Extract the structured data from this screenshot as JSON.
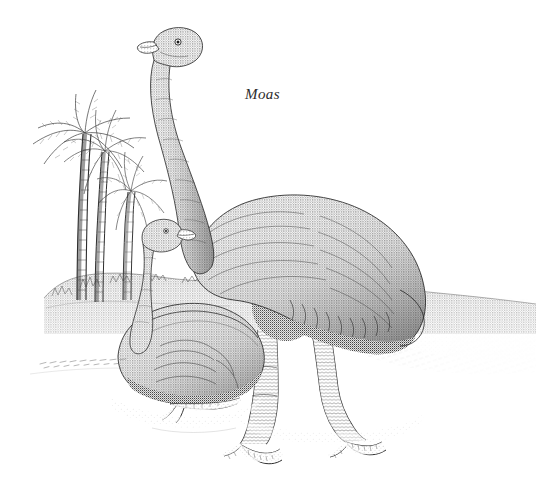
{
  "plate": {
    "caption": "Moas",
    "background_color": "#ffffff",
    "ink_color": "#2b2b2b",
    "width": 536,
    "height": 487,
    "medium": "stipple-engraving",
    "style_note": "black-and-white stippled pen-and-ink natural-history engraving"
  },
  "subjects": [
    {
      "id": "standing-moa",
      "label": "Standing moa",
      "pose": "upright, long neck curved, head raised facing left",
      "parts": [
        "head",
        "beak",
        "eye",
        "long-neck",
        "feathered-body",
        "thigh",
        "scaly-legs",
        "three-toed-feet"
      ]
    },
    {
      "id": "sitting-moa",
      "label": "Sitting moa",
      "pose": "crouched on ground in foreground, neck raised, head facing left",
      "parts": [
        "head",
        "beak",
        "eye",
        "neck",
        "feathered-body",
        "outstretched-foot"
      ]
    }
  ],
  "scenery": {
    "palms": {
      "label": "Palm trees",
      "count": 3,
      "position": "background left"
    },
    "hillside": {
      "label": "Hillside ridge",
      "position": "middle ground behind birds"
    },
    "shadow": {
      "label": "Cast ground shadow",
      "position": "right of standing moa"
    },
    "ground_line": {
      "label": "Foreground ground line",
      "position": "left foreground, faint dashed strokes"
    }
  },
  "colors": {
    "paper": "#ffffff",
    "ink": "#2b2b2b",
    "ink_light": "#6f6f6f",
    "ink_mid": "#4a4a4a"
  }
}
